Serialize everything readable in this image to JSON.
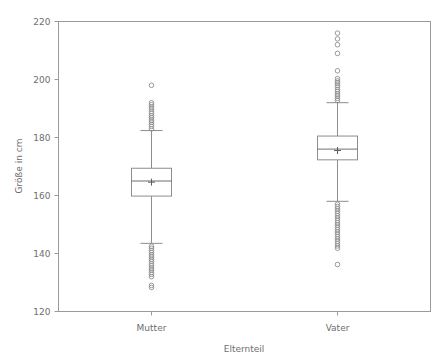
{
  "chart_data": {
    "type": "box",
    "title": "",
    "xlabel": "Elternteil",
    "ylabel": "Größe in cm",
    "categories": [
      "Mutter",
      "Vater"
    ],
    "ylim": [
      120,
      220
    ],
    "yticks": [
      120,
      140,
      160,
      180,
      200,
      220
    ],
    "ytick_labels": [
      "120",
      "140",
      "160",
      "180",
      "200",
      "220"
    ],
    "grid": false,
    "legend": "none",
    "series": [
      {
        "name": "Mutter",
        "min_whisker": 143.5,
        "q1": 159.8,
        "median": 165.0,
        "mean": 164.6,
        "q3": 169.4,
        "max_whisker": 182.4,
        "outliers_low": [
          142.5,
          141.8,
          141.0,
          140.3,
          139.5,
          138.8,
          138.0,
          137.3,
          136.5,
          135.8,
          135.0,
          134.3,
          133.5,
          132.8,
          132.0,
          129.0,
          128.3
        ],
        "outliers_high": [
          183.0,
          183.8,
          184.5,
          185.3,
          186.0,
          186.8,
          187.5,
          188.3,
          189.0,
          189.8,
          190.5,
          191.3,
          192.0,
          198.0
        ]
      },
      {
        "name": "Vater",
        "min_whisker": 158.0,
        "q1": 172.3,
        "median": 176.0,
        "mean": 175.5,
        "q3": 180.5,
        "max_whisker": 192.0,
        "outliers_low": [
          157.0,
          156.2,
          155.4,
          154.6,
          153.8,
          153.0,
          152.2,
          151.4,
          150.6,
          149.8,
          149.0,
          148.2,
          147.4,
          146.6,
          145.8,
          145.0,
          144.2,
          143.4,
          142.6,
          141.8,
          136.2
        ],
        "outliers_high": [
          192.8,
          193.5,
          194.3,
          195.0,
          195.8,
          196.5,
          197.3,
          198.0,
          198.8,
          199.5,
          200.3,
          203.0,
          209.0,
          212.0,
          214.0,
          216.0
        ]
      }
    ]
  },
  "colors": {
    "axis": "#9a9a9a",
    "box_stroke": "#8d8d8d",
    "text": "#6e6e6e",
    "background": "#ffffff"
  }
}
